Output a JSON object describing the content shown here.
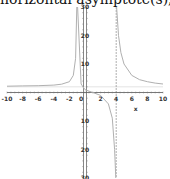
{
  "title": "horizontal asymptote(s), y",
  "chart_data": {
    "type": "line",
    "title": "horizontal asymptote(s), y",
    "xlabel": "x",
    "ylabel": "",
    "xlim": [
      -10,
      10
    ],
    "ylim": [
      -30,
      30
    ],
    "x_ticks": [
      -10,
      -8,
      -6,
      -4,
      -2,
      0,
      2,
      4,
      6,
      8,
      10
    ],
    "x_tick_labels": [
      "-10",
      "-8",
      "-6",
      "-4",
      "-2",
      "0",
      "2",
      "4",
      "6",
      "8",
      "10"
    ],
    "y_ticks": [
      -30,
      -20,
      -10,
      10,
      20,
      30
    ],
    "y_tick_labels": [
      "-30",
      "-20",
      "-10",
      "10",
      "20",
      "30"
    ],
    "grid": false,
    "vertical_asymptotes": [
      -1,
      4
    ],
    "horizontal_asymptote": 2,
    "series": [
      {
        "name": "f(x)",
        "color": "#b0b0b0",
        "branches": [
          {
            "x": [
              -10,
              -8,
              -6,
              -4,
              -3,
              -2,
              -1.5,
              -1.2,
              -1.05
            ],
            "y": [
              2.2,
              2.3,
              2.4,
              2.6,
              2.9,
              3.8,
              6,
              12,
              30
            ]
          },
          {
            "x": [
              -0.95,
              -0.5,
              0,
              1,
              2,
              3,
              3.5,
              3.8,
              3.95
            ],
            "y": [
              30,
              3,
              1,
              0,
              -1,
              -4,
              -9,
              -20,
              -30
            ]
          },
          {
            "x": [
              4.05,
              4.3,
              4.6,
              5,
              6,
              7,
              8,
              9,
              10
            ],
            "y": [
              30,
              20,
              14,
              10,
              6,
              4.5,
              3.8,
              3.3,
              3.0
            ]
          }
        ]
      }
    ],
    "axis_color": "#555555",
    "asymptote_color": "#999999"
  }
}
